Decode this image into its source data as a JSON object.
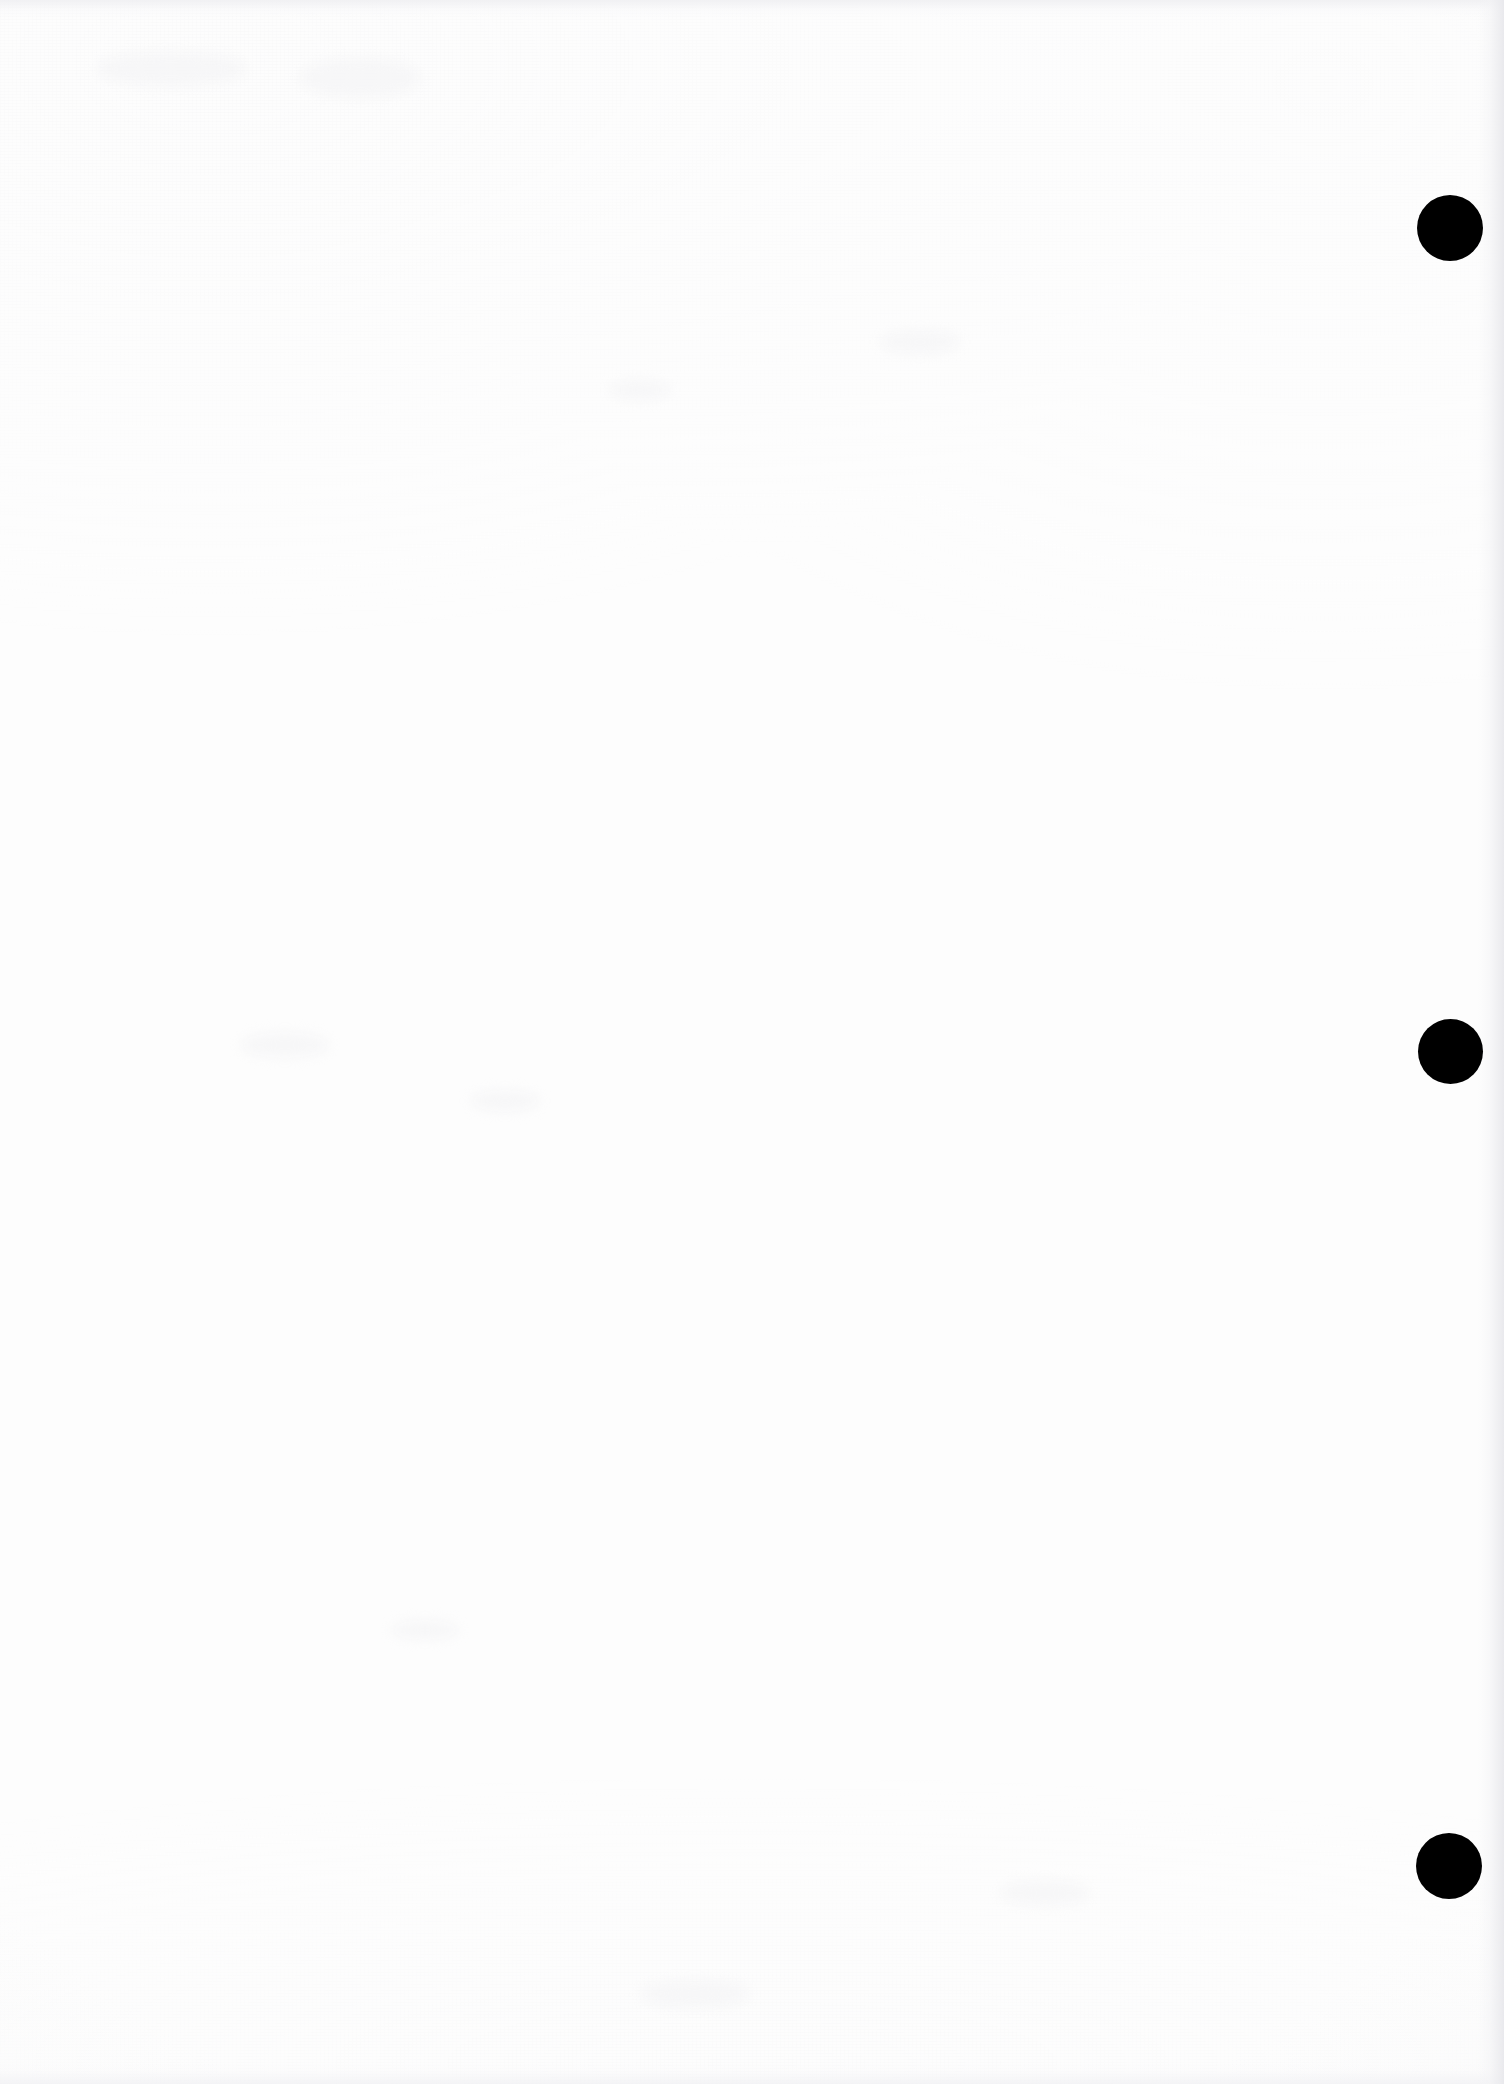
{
  "page": {
    "kind": "scanned-blank-page",
    "width": 1504,
    "height": 2084,
    "background_color": "#fdfdfd",
    "content_text": "",
    "note": ""
  },
  "colors": {
    "paper": "#fdfdfd",
    "mark": "#000000",
    "edge_shadow": "#e8e8ec",
    "grain": "#ececee"
  },
  "margin_marks": {
    "count": 3,
    "shape": "circle",
    "fill_color": "#000000",
    "items": [
      {
        "label": "mark-1",
        "cx": 1450,
        "cy": 228,
        "diameter": 66
      },
      {
        "label": "mark-2",
        "cx": 1450,
        "cy": 1051,
        "diameter": 65
      },
      {
        "label": "mark-3",
        "cx": 1449,
        "cy": 1866,
        "diameter": 66
      }
    ]
  },
  "edges": {
    "right_band": {
      "x": 1478,
      "width": 26
    },
    "top_band": {
      "y": 0,
      "height": 18
    },
    "bottom_band": {
      "y": 2062,
      "height": 22
    }
  },
  "ghosts": [
    {
      "x": 96,
      "y": 52,
      "w": 150,
      "h": 34
    },
    {
      "x": 300,
      "y": 58,
      "w": 120,
      "h": 40
    },
    {
      "x": 240,
      "y": 1032,
      "w": 90,
      "h": 26
    },
    {
      "x": 470,
      "y": 1090,
      "w": 70,
      "h": 22
    },
    {
      "x": 610,
      "y": 380,
      "w": 60,
      "h": 20
    },
    {
      "x": 880,
      "y": 330,
      "w": 80,
      "h": 24
    },
    {
      "x": 390,
      "y": 1620,
      "w": 70,
      "h": 20
    },
    {
      "x": 1000,
      "y": 1880,
      "w": 90,
      "h": 26
    },
    {
      "x": 640,
      "y": 1980,
      "w": 110,
      "h": 28
    }
  ]
}
